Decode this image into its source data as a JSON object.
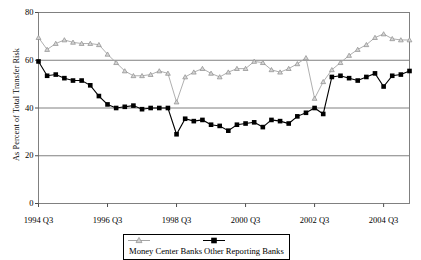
{
  "chart_data": {
    "type": "line",
    "title": "",
    "xlabel": "",
    "ylabel": "As Percent of Total Transfer Risk",
    "ylim": [
      0,
      80
    ],
    "yticks": [
      0,
      20,
      40,
      60,
      80
    ],
    "ytick_labels": [
      "0",
      "20",
      "40",
      "60",
      "80"
    ],
    "xtick_labels": [
      "1994 Q3",
      "1996 Q3",
      "1998 Q3",
      "2000 Q3",
      "2002 Q3",
      "2004 Q3"
    ],
    "xtick_indices": [
      0,
      8,
      16,
      24,
      32,
      40
    ],
    "grid": "horizontal",
    "legend_position": "bottom-center",
    "x": [
      "1994 Q3",
      "1994 Q4",
      "1995 Q1",
      "1995 Q2",
      "1995 Q3",
      "1995 Q4",
      "1996 Q1",
      "1996 Q2",
      "1996 Q3",
      "1996 Q4",
      "1997 Q1",
      "1997 Q2",
      "1997 Q3",
      "1997 Q4",
      "1998 Q1",
      "1998 Q2",
      "1998 Q3",
      "1998 Q4",
      "1999 Q1",
      "1999 Q2",
      "1999 Q3",
      "1999 Q4",
      "2000 Q1",
      "2000 Q2",
      "2000 Q3",
      "2000 Q4",
      "2001 Q1",
      "2001 Q2",
      "2001 Q3",
      "2001 Q4",
      "2002 Q1",
      "2002 Q2",
      "2002 Q3",
      "2002 Q4",
      "2003 Q1",
      "2003 Q2",
      "2003 Q3",
      "2003 Q4",
      "2004 Q1",
      "2004 Q2",
      "2004 Q3",
      "2004 Q4",
      "2005 Q1",
      "2005 Q2"
    ],
    "series": [
      {
        "name": "Money Center Banks",
        "color": "#a6a6a6",
        "marker": "triangle",
        "values": [
          69.5,
          64.5,
          67.0,
          68.5,
          67.5,
          67.0,
          67.0,
          66.5,
          62.5,
          59.0,
          55.5,
          53.5,
          53.5,
          54.0,
          55.5,
          54.5,
          42.5,
          53.0,
          55.0,
          56.5,
          54.5,
          53.0,
          55.0,
          56.5,
          56.5,
          59.5,
          59.0,
          56.0,
          55.0,
          56.5,
          58.5,
          61.0,
          44.0,
          51.0,
          56.0,
          59.0,
          62.0,
          64.5,
          66.5,
          69.5,
          71.0,
          69.0,
          68.5,
          68.5
        ]
      },
      {
        "name": "Other Reporting Banks",
        "color": "#000000",
        "marker": "square",
        "values": [
          59.5,
          53.5,
          54.0,
          52.5,
          51.5,
          51.5,
          49.5,
          45.0,
          41.5,
          40.0,
          40.5,
          41.0,
          39.5,
          40.0,
          40.0,
          40.0,
          29.0,
          35.5,
          34.5,
          35.0,
          33.0,
          32.5,
          30.5,
          33.0,
          33.5,
          34.0,
          32.0,
          35.0,
          34.5,
          33.5,
          36.5,
          38.0,
          40.0,
          37.5,
          53.0,
          53.5,
          52.5,
          51.5,
          53.0,
          54.5,
          49.0,
          53.5,
          54.0,
          55.5
        ]
      }
    ]
  },
  "legend": {
    "items": [
      {
        "label": "Money Center Banks"
      },
      {
        "label": "Other Reporting Banks"
      }
    ]
  }
}
